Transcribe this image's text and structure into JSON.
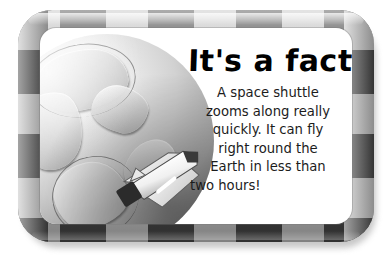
{
  "card": {
    "headline": "It's a fact!",
    "body_lines": [
      "A space shuttle",
      "zooms along really",
      "quickly. It can fly",
      "right round the",
      "Earth in less than",
      "two hours!"
    ],
    "body_text": "A space shuttle zooms along really quickly. It can fly right round the Earth in less than two hours!"
  },
  "illustration": {
    "globe_label": "earth-globe",
    "shuttle_label": "space-shuttle"
  },
  "colors": {
    "frame_light": "#c2c2c2",
    "frame_dark": "#484848",
    "panel_background": "#ffffff",
    "text": "#1c1c1c",
    "headline": "#000000",
    "page_background": "#ffffff"
  }
}
